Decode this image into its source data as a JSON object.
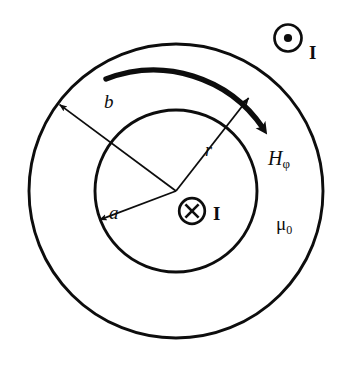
{
  "figure": {
    "background_color": "#ffffff",
    "line_color": "#0d0d0d"
  },
  "geometry": {
    "center": {
      "x": 176,
      "y": 191
    },
    "outer_circle": {
      "radius": 147,
      "label": "b"
    },
    "inner_circle": {
      "radius": 81,
      "label": "a"
    },
    "current_out_symbol": {
      "x": 288,
      "y": 38,
      "radius": 14,
      "glyph": "dot"
    },
    "current_in_symbol": {
      "x": 192,
      "y": 211,
      "radius": 13,
      "glyph": "cross"
    },
    "radius_arrows": [
      {
        "name": "b",
        "angle_deg": 215,
        "length": 147
      },
      {
        "name": "a",
        "angle_deg": 200,
        "length": 81
      },
      {
        "name": "r",
        "angle_deg": 52,
        "length": 118
      }
    ],
    "field_arc": {
      "start_angle_deg": 122,
      "end_angle_deg": 48,
      "radius": 132,
      "direction": "clockwise"
    }
  },
  "labels": {
    "inner_radius": "a",
    "outer_radius": "b",
    "field_radius": "r",
    "field_symbol": "H",
    "field_subscript": "φ",
    "permeability_symbol": "μ",
    "permeability_subscript": "0",
    "current_outer": "I",
    "current_inner": "I"
  },
  "symbols": {
    "current_out_of_page": "circle-dot-icon",
    "current_into_page": "circle-cross-icon",
    "field_direction": "curved-arrow-icon"
  }
}
